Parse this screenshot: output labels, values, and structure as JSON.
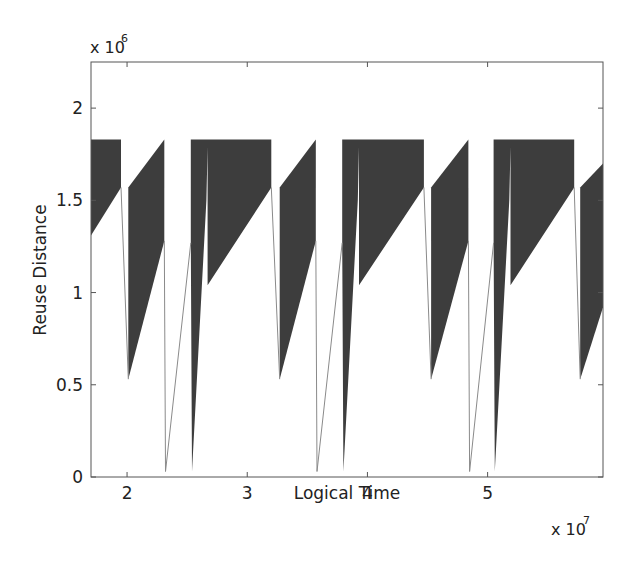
{
  "chart_data": {
    "type": "area",
    "title": "",
    "xlabel": "Logical Time",
    "ylabel": "Reuse Distance",
    "x_multiplier_label": "x 10",
    "x_multiplier_exp": "7",
    "y_multiplier_label": "x 10",
    "y_multiplier_exp": "6",
    "xlim": [
      1.7,
      5.96
    ],
    "ylim": [
      0,
      2.25
    ],
    "x_ticks": [
      2,
      3,
      4,
      5
    ],
    "x_tick_labels": [
      "2",
      "3",
      "4",
      "5"
    ],
    "y_ticks": [
      0,
      0.5,
      1,
      1.5,
      2
    ],
    "y_tick_labels": [
      "0",
      "0.5",
      "1",
      "1.5",
      "2"
    ],
    "grid": false,
    "legend": null,
    "fill_color": "#3d3d3d",
    "line_color": "#8a8a8a",
    "period": 1.264,
    "filled_regions": [
      [
        [
          1.7,
          1.83
        ],
        [
          1.95,
          1.83
        ],
        [
          1.95,
          1.57
        ],
        [
          1.7,
          1.31
        ]
      ],
      [
        [
          2.01,
          1.57
        ],
        [
          2.31,
          1.83
        ],
        [
          2.31,
          1.28
        ],
        [
          2.01,
          0.53
        ]
      ],
      [
        [
          2.53,
          1.83
        ],
        [
          3.2,
          1.83
        ],
        [
          3.2,
          1.57
        ],
        [
          2.67,
          1.04
        ],
        [
          2.67,
          1.79
        ],
        [
          2.66,
          1.5
        ],
        [
          2.54,
          0.03
        ],
        [
          2.53,
          1.28
        ]
      ],
      [
        [
          3.27,
          1.57
        ],
        [
          3.57,
          1.83
        ],
        [
          3.57,
          1.28
        ],
        [
          3.27,
          0.53
        ]
      ],
      [
        [
          3.79,
          1.83
        ],
        [
          4.47,
          1.83
        ],
        [
          4.47,
          1.57
        ],
        [
          3.93,
          1.04
        ],
        [
          3.93,
          1.79
        ],
        [
          3.92,
          1.5
        ],
        [
          3.8,
          0.03
        ],
        [
          3.79,
          1.28
        ]
      ],
      [
        [
          4.53,
          1.57
        ],
        [
          4.84,
          1.83
        ],
        [
          4.84,
          1.28
        ],
        [
          4.53,
          0.53
        ]
      ],
      [
        [
          5.05,
          1.83
        ],
        [
          5.72,
          1.83
        ],
        [
          5.72,
          1.57
        ],
        [
          5.19,
          1.04
        ],
        [
          5.19,
          1.79
        ],
        [
          5.18,
          1.5
        ],
        [
          5.06,
          0.03
        ],
        [
          5.05,
          1.28
        ]
      ],
      [
        [
          5.77,
          1.57
        ],
        [
          5.96,
          1.7
        ],
        [
          5.96,
          0.92
        ],
        [
          5.77,
          0.53
        ]
      ]
    ],
    "thin_lines": [
      [
        [
          1.95,
          1.57
        ],
        [
          2.01,
          0.53
        ]
      ],
      [
        [
          2.31,
          1.28
        ],
        [
          2.32,
          0.03
        ],
        [
          2.53,
          1.27
        ]
      ],
      [
        [
          3.2,
          1.57
        ],
        [
          3.27,
          0.53
        ]
      ],
      [
        [
          3.57,
          1.28
        ],
        [
          3.58,
          0.03
        ],
        [
          3.79,
          1.27
        ]
      ],
      [
        [
          4.47,
          1.57
        ],
        [
          4.53,
          0.53
        ]
      ],
      [
        [
          4.84,
          1.28
        ],
        [
          4.85,
          0.03
        ],
        [
          5.05,
          1.27
        ]
      ],
      [
        [
          5.72,
          1.57
        ],
        [
          5.77,
          0.53
        ]
      ]
    ]
  }
}
